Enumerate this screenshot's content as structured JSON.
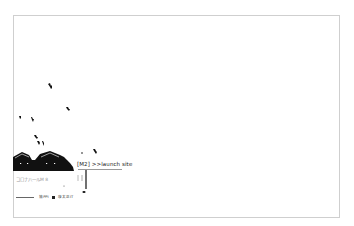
{
  "page": {
    "frame_border_color": "#cfcfcf",
    "background_color": "#ffffff",
    "silhouette_color": "#111111"
  },
  "main": {
    "link_label": "[M2] >>launch site",
    "subtitle": "コロナ八一ルM 8",
    "footer": {
      "lead": "——",
      "item1": "協PPI",
      "item2": "康太正IT"
    }
  },
  "icons": [
    "bird-icon",
    "house-silhouette-icon",
    "square-bullet-icon"
  ]
}
